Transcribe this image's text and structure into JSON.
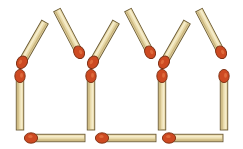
{
  "scene": {
    "title": "Matchstick puzzle - three houses",
    "width": 243,
    "height": 149,
    "background_color": "#ffffff",
    "match_count": 15
  },
  "colors": {
    "background": "#ffffff",
    "stick_fill": "#e8d9a8",
    "stick_highlight": "#f5ecca",
    "stick_shadow": "#cbb780",
    "stick_outline": "#6b5a33",
    "head_fill": "#cd4a22",
    "head_highlight": "#e2703f",
    "head_outline": "#7a2c10"
  },
  "geometry": {
    "stick_width": 7.5,
    "head_rx": 5.2,
    "head_ry": 6.6
  },
  "matches": [
    {
      "id": "roof-1-left",
      "group": "roof",
      "orientation": "diagonal-up-right",
      "head_end": "top",
      "x1": 21,
      "y1": 64,
      "x2": 45,
      "y2": 22
    },
    {
      "id": "roof-1-right",
      "group": "roof",
      "orientation": "diagonal-down-right",
      "head_end": "bottom",
      "x1": 57,
      "y1": 10,
      "x2": 80,
      "y2": 54
    },
    {
      "id": "roof-2-left",
      "group": "roof",
      "orientation": "diagonal-up-right",
      "head_end": "top",
      "x1": 92,
      "y1": 64,
      "x2": 116,
      "y2": 22
    },
    {
      "id": "roof-2-right",
      "group": "roof",
      "orientation": "diagonal-down-right",
      "head_end": "bottom",
      "x1": 128,
      "y1": 10,
      "x2": 151,
      "y2": 54
    },
    {
      "id": "roof-3-left",
      "group": "roof",
      "orientation": "diagonal-up-right",
      "head_end": "top",
      "x1": 163,
      "y1": 64,
      "x2": 187,
      "y2": 22
    },
    {
      "id": "roof-3-right",
      "group": "roof",
      "orientation": "diagonal-down-right",
      "head_end": "bottom",
      "x1": 199,
      "y1": 10,
      "x2": 222,
      "y2": 54
    },
    {
      "id": "wall-1",
      "group": "wall",
      "orientation": "vertical",
      "head_end": "top",
      "x1": 20,
      "y1": 74,
      "x2": 20,
      "y2": 130
    },
    {
      "id": "wall-2",
      "group": "wall",
      "orientation": "vertical",
      "head_end": "top",
      "x1": 91,
      "y1": 74,
      "x2": 91,
      "y2": 130
    },
    {
      "id": "wall-3",
      "group": "wall",
      "orientation": "vertical",
      "head_end": "top",
      "x1": 162,
      "y1": 74,
      "x2": 162,
      "y2": 130
    },
    {
      "id": "wall-4",
      "group": "wall",
      "orientation": "vertical",
      "head_end": "top",
      "x1": 224,
      "y1": 74,
      "x2": 224,
      "y2": 130
    },
    {
      "id": "floor-1",
      "group": "floor",
      "orientation": "horizontal",
      "head_end": "left",
      "x1": 29,
      "y1": 138,
      "x2": 85,
      "y2": 138
    },
    {
      "id": "floor-2",
      "group": "floor",
      "orientation": "horizontal",
      "head_end": "left",
      "x1": 100,
      "y1": 138,
      "x2": 156,
      "y2": 138
    },
    {
      "id": "floor-3",
      "group": "floor",
      "orientation": "horizontal",
      "head_end": "left",
      "x1": 167,
      "y1": 138,
      "x2": 223,
      "y2": 138
    }
  ]
}
